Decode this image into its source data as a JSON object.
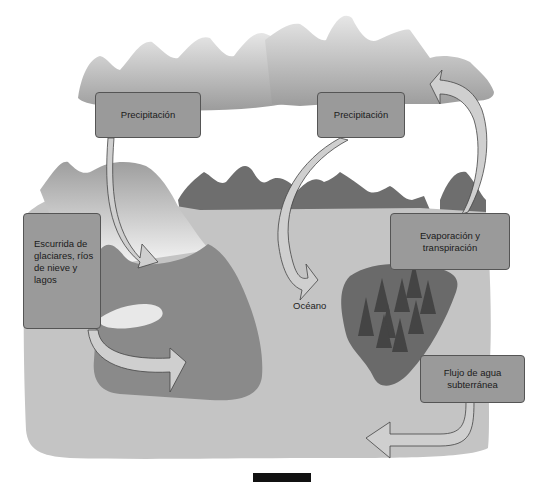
{
  "diagram": {
    "labels": {
      "precipitation_left": "Precipitación",
      "precipitation_right": "Precipitación",
      "runoff": "Escurrida de glaciares, ríos de nieve y lagos",
      "evaporation": "Evaporación y transpiración",
      "ocean": "Océano",
      "groundwater": "Flujo de agua subterránea"
    },
    "colors": {
      "background": "#ffffff",
      "cloud": "#a8a8a8",
      "far_mountains": "#6e6e6e",
      "land": "#c4c4c4",
      "near_land": "#8a8a8a",
      "forest_patch": "#6a6a6a",
      "trees": "#444444",
      "arrow_fill": "#cfcfcf",
      "arrow_stroke": "#444444",
      "label_box": "#9a9a9a"
    },
    "page_marker": ""
  }
}
